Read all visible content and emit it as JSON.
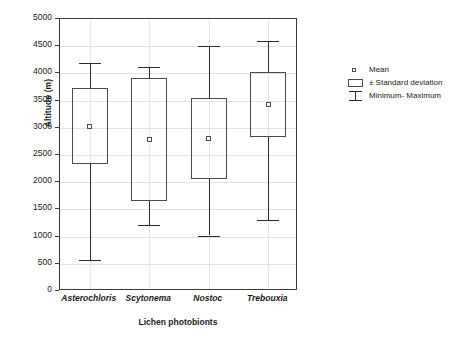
{
  "chart_data": {
    "type": "bar",
    "title": "",
    "subtitle": "",
    "xlabel": "Lichen photobionts",
    "ylabel": "Altitude (m)",
    "ylim": [
      0,
      5000
    ],
    "ytick_labels": [
      "5000",
      "4500",
      "4000",
      "3500",
      "3000",
      "2500",
      "2000",
      "1500",
      "1000",
      "500",
      "0"
    ],
    "ytick_values": [
      5000,
      4500,
      4000,
      3500,
      3000,
      2500,
      2000,
      1500,
      1000,
      500,
      0
    ],
    "grid": true,
    "legend_position": "right",
    "categories": [
      "Asterochloris",
      "Scytonema",
      "Nostoc",
      "Trebouxia"
    ],
    "series": [
      {
        "name": "Mean",
        "values": [
          3030,
          2780,
          2810,
          3420
        ]
      },
      {
        "name": "SD lower",
        "values": [
          2330,
          1660,
          2060,
          2840
        ]
      },
      {
        "name": "SD upper",
        "values": [
          3730,
          3910,
          3540,
          4030
        ]
      },
      {
        "name": "Minimum",
        "values": [
          570,
          1210,
          1020,
          1310
        ]
      },
      {
        "name": "Maximum",
        "values": [
          4200,
          4120,
          4500,
          4600
        ]
      }
    ],
    "boxes": [
      {
        "category": "Asterochloris",
        "min": 570,
        "sd_low": 2330,
        "mean": 3030,
        "sd_high": 3730,
        "max": 4200
      },
      {
        "category": "Scytonema",
        "min": 1210,
        "sd_low": 1660,
        "mean": 2780,
        "sd_high": 3910,
        "max": 4120
      },
      {
        "category": "Nostoc",
        "min": 1020,
        "sd_low": 2060,
        "mean": 2810,
        "sd_high": 3540,
        "max": 4500
      },
      {
        "category": "Trebouxia",
        "min": 1310,
        "sd_low": 2840,
        "mean": 3420,
        "sd_high": 4030,
        "max": 4600
      }
    ],
    "legend": [
      {
        "key": "mean-marker",
        "label": "Mean"
      },
      {
        "key": "box-rect",
        "label": "± Standard deviation"
      },
      {
        "key": "range-bar",
        "label": "Minimum- Maximum"
      }
    ],
    "colors": {
      "line": "#2b2b2b",
      "box_border": "#4a4a4a",
      "frame": "#3a3a3a",
      "grid": "#e2e2e2",
      "background": "#ffffff",
      "text": "#1a1a1a"
    }
  }
}
